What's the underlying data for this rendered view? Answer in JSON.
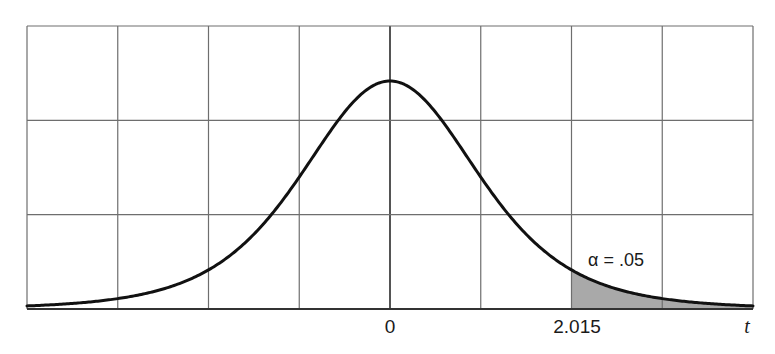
{
  "chart_data": {
    "type": "area",
    "title": "",
    "xlabel": "t",
    "ylabel": "",
    "x_tick_labels": [
      {
        "value": 0,
        "label": "0"
      },
      {
        "value": 2.015,
        "label": "2.015"
      }
    ],
    "axis_label_right": "t",
    "grid": true,
    "grid_columns": 8,
    "grid_rows": 3,
    "distribution": "t",
    "degrees_of_freedom": 5,
    "critical_value": 2.015,
    "shaded_region": {
      "from": 2.015,
      "to": "infinity",
      "area": 0.05,
      "color": "#a9a9a9"
    },
    "annotation": {
      "text": "α = .05",
      "symbol": "α",
      "value": ".05"
    },
    "x_range": [
      -4.0,
      4.0
    ],
    "curve_color": "#111111",
    "grid_color": "#6e6e6e",
    "legend": null
  },
  "labels": {
    "zero": "0",
    "critical": "2.015",
    "axis": "t",
    "alpha": "α = .05"
  }
}
